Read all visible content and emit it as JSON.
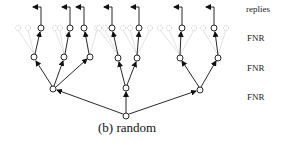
{
  "diagram": {
    "caption": "(b) random",
    "row_labels": [
      "replies",
      "FNR",
      "FNR",
      "FNR"
    ],
    "colors": {
      "edge": "#111111",
      "node_stroke": "#111111",
      "faded": "#bbbbbb"
    },
    "nodes": {
      "root": [
        126,
        116
      ],
      "level2": [
        [
          53,
          89
        ],
        [
          126,
          88
        ],
        [
          200,
          90
        ]
      ],
      "level3": [
        [
          34,
          57
        ],
        [
          64,
          57
        ],
        [
          90,
          57
        ],
        [
          118,
          58
        ],
        [
          137,
          58
        ],
        [
          180,
          58
        ],
        [
          218,
          58
        ]
      ],
      "level4": [
        [
          41,
          28
        ],
        [
          70,
          28
        ],
        [
          84,
          28
        ],
        [
          112,
          28
        ],
        [
          139,
          28
        ],
        [
          182,
          28
        ],
        [
          214,
          28
        ]
      ]
    }
  }
}
